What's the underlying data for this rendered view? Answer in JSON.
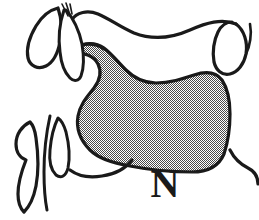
{
  "figure": {
    "background_color": "#ffffff",
    "stroke_color": "#1a1a1a",
    "shade_color": "#9a9a9a",
    "width": 259,
    "height": 220
  },
  "label": {
    "phoneme": "N",
    "font_style": "serif-bold"
  },
  "articulators": [
    {
      "name": "upper-lip",
      "label": "Upper lip"
    },
    {
      "name": "lower-lip",
      "label": "Lower lip"
    },
    {
      "name": "upper-teeth",
      "label": "Upper teeth"
    },
    {
      "name": "lower-teeth",
      "label": "Lower teeth"
    },
    {
      "name": "hard-palate",
      "label": "Hard palate"
    },
    {
      "name": "alveolar-ridge",
      "label": "Alveolar ridge"
    },
    {
      "name": "velum",
      "label": "Velum"
    },
    {
      "name": "uvula",
      "label": "Uvula"
    },
    {
      "name": "tongue",
      "label": "Tongue"
    },
    {
      "name": "pharyngeal-wall",
      "label": "Pharyngeal wall"
    },
    {
      "name": "jaw-line",
      "label": "Jaw line"
    }
  ]
}
